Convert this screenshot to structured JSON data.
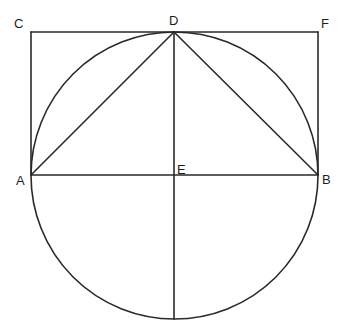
{
  "diagram": {
    "labels": {
      "C": "C",
      "D": "D",
      "F": "F",
      "A": "A",
      "E": "E",
      "B": "B"
    },
    "points": {
      "C": [
        31,
        32
      ],
      "D": [
        174,
        32
      ],
      "F": [
        318,
        32
      ],
      "A": [
        31,
        175
      ],
      "E": [
        174,
        175
      ],
      "B": [
        318,
        175
      ],
      "bottom": [
        174,
        319
      ]
    },
    "circle": {
      "center": "E",
      "rx": 143.5,
      "ry": 143.5
    },
    "segments": [
      "CF",
      "CA",
      "FB",
      "AB",
      "DA",
      "DB",
      "D-bottom"
    ],
    "stroke_color": "#2a2a2a"
  }
}
